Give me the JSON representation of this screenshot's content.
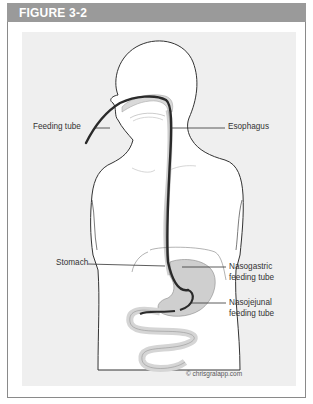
{
  "figure": {
    "title": "FIGURE 3-2",
    "header_color": "#9a9a9a",
    "panel_color": "#efefef",
    "tube_color": "#2a2a2a",
    "organ_color": "#cfcfcf"
  },
  "labels": {
    "feeding_tube": "Feeding tube",
    "esophagus": "Esophagus",
    "stomach": "Stomach",
    "nasogastric_line1": "Nasogastric",
    "nasogastric_line2": "feeding tube",
    "nasojejunal_line1": "Nasojejunal",
    "nasojejunal_line2": "feeding tube"
  },
  "credit": "© chrisgralapp.com"
}
